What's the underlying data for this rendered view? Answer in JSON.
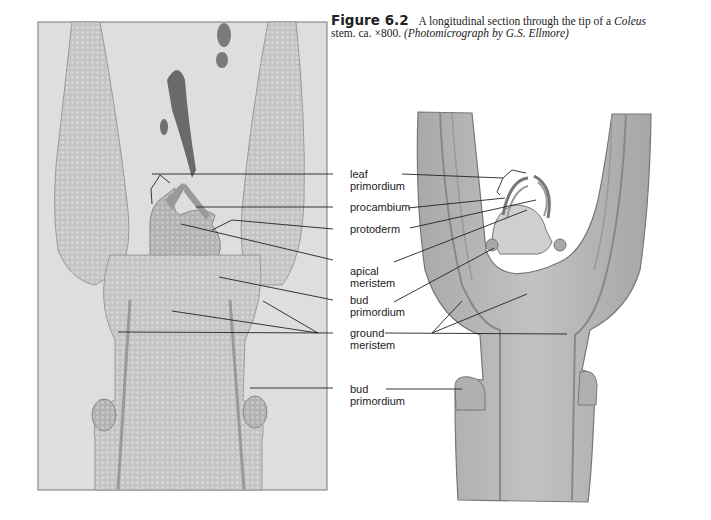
{
  "caption": {
    "figure_number": "Figure 6.2",
    "text_part1": "A longitudinal section through the tip of a ",
    "text_italic": "Coleus",
    "text_part2": "stem. ca. ×800. ",
    "credit": "(Photomicrograph by G.S. Ellmore)"
  },
  "left_panel": {
    "type": "photomicrograph",
    "description": "Light micrograph of Coleus shoot apex, longitudinal section"
  },
  "right_panel": {
    "type": "drawing",
    "description": "Shaded pencil drawing of Coleus shoot apex"
  },
  "labels": [
    {
      "line1": "leaf",
      "line2": "primordium"
    },
    {
      "line1": "procambium",
      "line2": ""
    },
    {
      "line1": "protoderm",
      "line2": ""
    },
    {
      "line1": "apical",
      "line2": "meristem"
    },
    {
      "line1": "bud",
      "line2": "primordium"
    },
    {
      "line1": "ground",
      "line2": "meristem"
    },
    {
      "line1": "bud",
      "line2": "primordium"
    }
  ],
  "colors": {
    "photo_bg": "#dcdcdc",
    "tissue": "#bdbdbd",
    "drawing_fill": "#b8b8b8",
    "line": "#222222"
  }
}
